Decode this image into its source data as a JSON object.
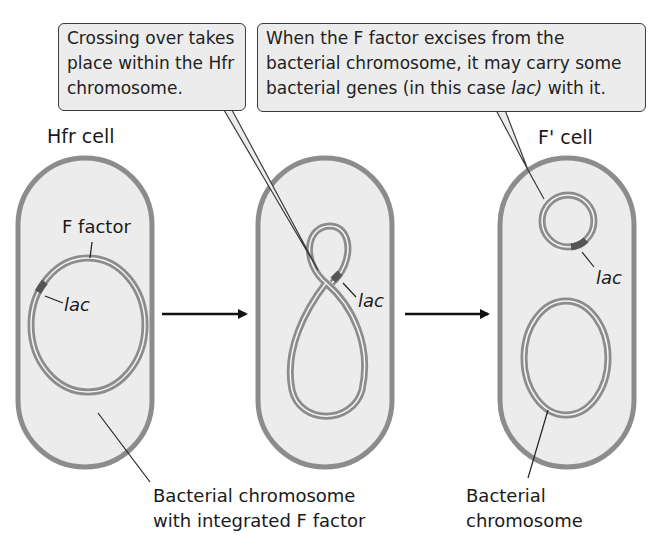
{
  "callouts": {
    "crossing_over": "Crossing over takes place within the Hfr chromosome.",
    "excision_prefix": "When the F factor excises from the bacterial chromosome, it may carry some bacterial genes (in this case ",
    "excision_gene": "lac)",
    "excision_suffix": " with it."
  },
  "cells": [
    {
      "title": "Hfr cell",
      "labels": {
        "f_factor": "F factor",
        "gene": "lac"
      }
    },
    {
      "title": "",
      "labels": {
        "gene": "lac"
      }
    },
    {
      "title": "F' cell",
      "labels": {
        "gene": "lac"
      }
    }
  ],
  "bottom_labels": {
    "hfr_line1": "Bacterial chromosome",
    "hfr_line2": "with integrated F factor",
    "fprime_line1": "Bacterial",
    "fprime_line2": "chromosome"
  },
  "colors": {
    "cell_fill": "#ececec",
    "cell_border": "#8c8c8c",
    "dna_strand": "#8c8c8c",
    "lac_marker": "#555555",
    "text": "#1a1a1a"
  }
}
